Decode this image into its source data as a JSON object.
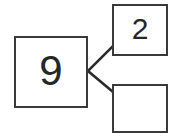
{
  "diagram": {
    "type": "number-bond",
    "colors": {
      "background": "#ffffff",
      "box_border": "#3a3a3a",
      "connector_line": "#2b2b2b",
      "text": "#262626"
    },
    "whole": {
      "label": "9",
      "role": "whole"
    },
    "parts": [
      {
        "label": "2",
        "role": "part",
        "position": "top-right"
      },
      {
        "label": "",
        "role": "part",
        "position": "bottom-right"
      }
    ],
    "connectors": [
      {
        "name": "whole-to-top-part",
        "from": [
          88,
          71
        ],
        "to": [
          113,
          46
        ]
      },
      {
        "name": "whole-to-bottom-part",
        "from": [
          88,
          71
        ],
        "to": [
          113,
          92
        ]
      }
    ]
  }
}
